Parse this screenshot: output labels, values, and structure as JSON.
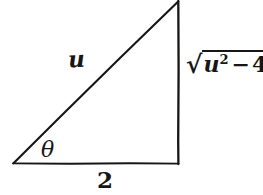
{
  "figure": {
    "type": "right-triangle-diagram",
    "background_color": "#ffffff",
    "stroke_color": "#161616",
    "stroke_width": 2
  },
  "geometry": {
    "vertices": {
      "left": {
        "x": 13,
        "y": 163
      },
      "bottom_right": {
        "x": 178,
        "y": 163
      },
      "top_right": {
        "x": 178,
        "y": 1
      }
    },
    "sides": [
      {
        "name": "adjacent",
        "from": "left",
        "to": "bottom_right",
        "label": "2"
      },
      {
        "name": "opposite",
        "from": "bottom_right",
        "to": "top_right",
        "label": "sqrt(u^2-4)"
      },
      {
        "name": "hypotenuse",
        "from": "left",
        "to": "top_right",
        "label": "u"
      }
    ],
    "right_angle_at": "bottom_right"
  },
  "labels": {
    "hypotenuse": "u",
    "angle": "θ",
    "base": "2",
    "opposite": {
      "radical_sign": "√",
      "radicand_base": "u",
      "radicand_exponent": "2",
      "radicand_operator": "−",
      "radicand_term": "4",
      "full_text": "√(u²−4)"
    }
  }
}
